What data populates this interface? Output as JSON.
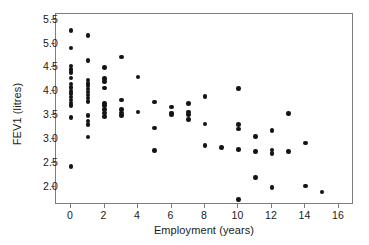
{
  "chart_data": {
    "type": "scatter",
    "title": "",
    "xlabel": "Employment (years)",
    "ylabel": "FEV1 (litres)",
    "xlim": [
      -0.9,
      16.9
    ],
    "ylim": [
      1.62,
      5.62
    ],
    "xticks": [
      0,
      2,
      4,
      6,
      8,
      10,
      12,
      14,
      16
    ],
    "xticklabels": [
      "0",
      "2",
      "4",
      "6",
      "8",
      "10",
      "12",
      "14",
      "16"
    ],
    "yticks": [
      2.0,
      2.5,
      3.0,
      3.5,
      4.0,
      4.5,
      5.0,
      5.5
    ],
    "yticklabels": [
      "2.0",
      "2.5",
      "3.0",
      "3.5",
      "4.0",
      "4.5",
      "5.0",
      "5.5"
    ],
    "grid": false,
    "legend": null,
    "marker": "filled-circle",
    "marker_color": "#141414",
    "frame_color": "#7d7d7d",
    "series": [
      {
        "name": "FEV1 vs employment",
        "points": [
          [
            0,
            5.28
          ],
          [
            0,
            4.91
          ],
          [
            0,
            4.53
          ],
          [
            0,
            4.46
          ],
          [
            0,
            4.39
          ],
          [
            0,
            4.28
          ],
          [
            0,
            4.15
          ],
          [
            0,
            4.08
          ],
          [
            0,
            4.01
          ],
          [
            0,
            3.95
          ],
          [
            0,
            3.88
          ],
          [
            0,
            3.82
          ],
          [
            0,
            3.76
          ],
          [
            0,
            3.7
          ],
          [
            0,
            3.45
          ],
          [
            0,
            2.43
          ],
          [
            1,
            5.17
          ],
          [
            1,
            4.65
          ],
          [
            1,
            4.24
          ],
          [
            1,
            4.17
          ],
          [
            1,
            4.11
          ],
          [
            1,
            4.05
          ],
          [
            1,
            3.99
          ],
          [
            1,
            3.92
          ],
          [
            1,
            3.86
          ],
          [
            1,
            3.79
          ],
          [
            1,
            3.5
          ],
          [
            1,
            3.38
          ],
          [
            1,
            3.3
          ],
          [
            1,
            3.04
          ],
          [
            2,
            4.5
          ],
          [
            2,
            4.27
          ],
          [
            2,
            4.21
          ],
          [
            2,
            4.07
          ],
          [
            2,
            3.75
          ],
          [
            2,
            3.7
          ],
          [
            2,
            3.62
          ],
          [
            2,
            3.55
          ],
          [
            2,
            3.47
          ],
          [
            3,
            4.72
          ],
          [
            3,
            3.82
          ],
          [
            3,
            3.62
          ],
          [
            3,
            3.55
          ],
          [
            3,
            3.49
          ],
          [
            4,
            4.3
          ],
          [
            4,
            3.57
          ],
          [
            5,
            3.78
          ],
          [
            5,
            3.23
          ],
          [
            5,
            2.76
          ],
          [
            6,
            3.67
          ],
          [
            6,
            3.55
          ],
          [
            6,
            3.51
          ],
          [
            7,
            3.74
          ],
          [
            7,
            3.57
          ],
          [
            7,
            3.52
          ],
          [
            7,
            3.41
          ],
          [
            8,
            3.89
          ],
          [
            8,
            3.32
          ],
          [
            8,
            2.86
          ],
          [
            9,
            2.83
          ],
          [
            10,
            4.06
          ],
          [
            10,
            3.3
          ],
          [
            10,
            3.21
          ],
          [
            10,
            2.78
          ],
          [
            10,
            1.73
          ],
          [
            11,
            3.06
          ],
          [
            11,
            2.74
          ],
          [
            11,
            2.2
          ],
          [
            12,
            3.18
          ],
          [
            12,
            2.77
          ],
          [
            12,
            2.7
          ],
          [
            12,
            1.99
          ],
          [
            13,
            3.54
          ],
          [
            13,
            2.74
          ],
          [
            14,
            2.92
          ],
          [
            14,
            2.02
          ],
          [
            15,
            1.89
          ]
        ]
      }
    ]
  }
}
